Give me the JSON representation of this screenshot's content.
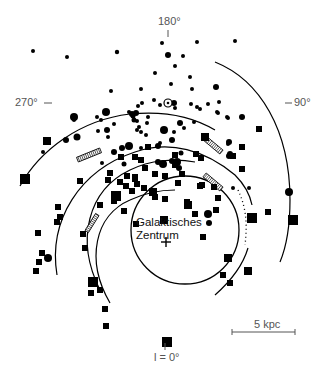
{
  "diagram": {
    "title": "",
    "center_label_line1": "Galaktisches",
    "center_label_line2": "Zentrum",
    "longitude_labels": {
      "top": "180°",
      "left": "270°",
      "right": "90°",
      "bottom": "l = 0°"
    },
    "scale_bar": {
      "label": "5 kpc",
      "length_px": 63
    },
    "colors": {
      "ink": "#000000",
      "label": "#555555",
      "background": "#ffffff"
    },
    "marker_types": [
      "circle",
      "square"
    ],
    "arcs": [
      {
        "name": "outer-arc",
        "cx": 163,
        "cy": 245,
        "r": 150,
        "start_deg": 195,
        "end_deg": 388
      },
      {
        "name": "arc-2",
        "cx": 163,
        "cy": 245,
        "r": 118,
        "start_deg": 200,
        "end_deg": 330
      },
      {
        "name": "arc-3",
        "cx": 163,
        "cy": 245,
        "r": 100,
        "start_deg": 190,
        "end_deg": 300
      },
      {
        "name": "inner-arc",
        "cx": 163,
        "cy": 245,
        "r": 74,
        "start_deg": 180,
        "end_deg": 420
      }
    ],
    "circles": [
      [
        117,
        52,
        2.2
      ],
      [
        33,
        51,
        2
      ],
      [
        67,
        57,
        2
      ],
      [
        162,
        43,
        2
      ],
      [
        197,
        42,
        2
      ],
      [
        168,
        55,
        3
      ],
      [
        183,
        56,
        2
      ],
      [
        155,
        73,
        2
      ],
      [
        171,
        84,
        2
      ],
      [
        235,
        41,
        2
      ],
      [
        190,
        77,
        2
      ],
      [
        192,
        89,
        2
      ],
      [
        141,
        89,
        2
      ],
      [
        191,
        104,
        2
      ],
      [
        142,
        103,
        2
      ],
      [
        133,
        116,
        2.5
      ],
      [
        134,
        120,
        2.5
      ],
      [
        74,
        117,
        4
      ],
      [
        106,
        112,
        4
      ],
      [
        137,
        121,
        2
      ],
      [
        139,
        127,
        2
      ],
      [
        141,
        132,
        2
      ],
      [
        154,
        100,
        2
      ],
      [
        147,
        123,
        2
      ],
      [
        164,
        130,
        4
      ],
      [
        172,
        140,
        3
      ],
      [
        180,
        123,
        3
      ],
      [
        184,
        128,
        2
      ],
      [
        194,
        122,
        2
      ],
      [
        160,
        143,
        2
      ],
      [
        181,
        153,
        2.5
      ],
      [
        200,
        109,
        2
      ],
      [
        218,
        113,
        2
      ],
      [
        216,
        87,
        3
      ],
      [
        177,
        162,
        4
      ],
      [
        172,
        161,
        3
      ],
      [
        108,
        137,
        2
      ],
      [
        129,
        146,
        4
      ],
      [
        141,
        148,
        2
      ],
      [
        146,
        135,
        2
      ],
      [
        158,
        146,
        3
      ],
      [
        66,
        140,
        3
      ],
      [
        77,
        137,
        3.5
      ],
      [
        43,
        152,
        2
      ],
      [
        174,
        103,
        3
      ],
      [
        174,
        132,
        2
      ],
      [
        233,
        188,
        2
      ],
      [
        249,
        188,
        2
      ],
      [
        107,
        130,
        3
      ],
      [
        114,
        124,
        2
      ],
      [
        74,
        120,
        2
      ],
      [
        208,
        104,
        2
      ],
      [
        217,
        112,
        2
      ],
      [
        179,
        168,
        3
      ],
      [
        197,
        107,
        2
      ],
      [
        219,
        102,
        2
      ],
      [
        229,
        142,
        3
      ],
      [
        48,
        258,
        4
      ],
      [
        228,
        118,
        2
      ],
      [
        227,
        117,
        2
      ],
      [
        137,
        130,
        2
      ],
      [
        209,
        223,
        3
      ],
      [
        208,
        214,
        4
      ],
      [
        175,
        66,
        2
      ],
      [
        160,
        105,
        2
      ],
      [
        111,
        91,
        2
      ],
      [
        228,
        144,
        2
      ],
      [
        242,
        117,
        3
      ],
      [
        229,
        156,
        3
      ],
      [
        289,
        192,
        4
      ],
      [
        97,
        117,
        2
      ],
      [
        148,
        117,
        2
      ],
      [
        101,
        120,
        2
      ],
      [
        129,
        112,
        2
      ],
      [
        136,
        113,
        3
      ],
      [
        175,
        108,
        2
      ],
      [
        114,
        152,
        3
      ],
      [
        122,
        148,
        3
      ],
      [
        230,
        154,
        3
      ],
      [
        98,
        131,
        2
      ],
      [
        132,
        114,
        3
      ],
      [
        138,
        106,
        2
      ],
      [
        102,
        163,
        2
      ],
      [
        124,
        164,
        2.5
      ],
      [
        163,
        164,
        4
      ],
      [
        158,
        162,
        3
      ]
    ],
    "squares": [
      [
        25,
        179,
        5
      ],
      [
        47,
        141,
        4
      ],
      [
        121,
        157,
        3
      ],
      [
        135,
        157,
        3
      ],
      [
        141,
        160,
        3
      ],
      [
        135,
        179,
        3
      ],
      [
        135,
        177,
        3
      ],
      [
        80,
        181,
        3
      ],
      [
        108,
        180,
        3
      ],
      [
        100,
        205,
        3
      ],
      [
        136,
        224,
        3
      ],
      [
        137,
        184,
        3
      ],
      [
        116,
        196,
        5
      ],
      [
        132,
        191,
        3
      ],
      [
        114,
        201,
        3
      ],
      [
        124,
        211,
        3
      ],
      [
        126,
        186,
        3
      ],
      [
        144,
        188,
        3
      ],
      [
        153,
        192,
        4
      ],
      [
        200,
        186,
        3
      ],
      [
        202,
        185,
        3
      ],
      [
        188,
        205,
        4
      ],
      [
        203,
        237,
        3
      ],
      [
        164,
        220,
        4
      ],
      [
        155,
        197,
        3
      ],
      [
        165,
        199,
        3
      ],
      [
        187,
        202,
        3
      ],
      [
        233,
        156,
        3
      ],
      [
        242,
        169,
        3
      ],
      [
        268,
        212,
        3
      ],
      [
        252,
        218,
        5
      ],
      [
        293,
        220,
        5
      ],
      [
        228,
        258,
        4
      ],
      [
        248,
        271,
        4
      ],
      [
        223,
        275,
        3
      ],
      [
        230,
        283,
        3
      ],
      [
        106,
        326,
        3
      ],
      [
        167,
        342,
        5
      ],
      [
        58,
        207,
        3
      ],
      [
        60,
        217,
        3
      ],
      [
        57,
        222,
        3
      ],
      [
        38,
        233,
        3
      ],
      [
        42,
        253,
        3
      ],
      [
        39,
        262,
        3
      ],
      [
        36,
        271,
        3
      ],
      [
        83,
        234,
        3
      ],
      [
        85,
        248,
        3
      ],
      [
        93,
        282,
        5
      ],
      [
        100,
        290,
        3
      ],
      [
        91,
        293,
        3
      ],
      [
        105,
        309,
        3
      ],
      [
        182,
        174,
        3
      ],
      [
        155,
        174,
        3
      ],
      [
        148,
        147,
        3
      ],
      [
        175,
        155,
        3
      ],
      [
        178,
        183,
        3
      ],
      [
        165,
        176,
        3
      ],
      [
        175,
        165,
        3
      ],
      [
        145,
        168,
        3
      ],
      [
        218,
        198,
        3
      ],
      [
        216,
        210,
        3
      ],
      [
        214,
        187,
        3
      ],
      [
        195,
        214,
        3
      ],
      [
        110,
        173,
        3
      ],
      [
        127,
        176,
        3
      ],
      [
        120,
        182,
        3
      ],
      [
        242,
        147,
        3
      ],
      [
        259,
        129,
        3
      ],
      [
        196,
        154,
        3
      ],
      [
        201,
        158,
        3
      ],
      [
        205,
        137,
        4
      ]
    ],
    "hatched_bars": [
      {
        "x": 89,
        "y": 155,
        "w": 25,
        "h": 5,
        "angle": -22
      },
      {
        "x": 92,
        "y": 223,
        "w": 20,
        "h": 4,
        "angle": -58
      },
      {
        "x": 213,
        "y": 145,
        "w": 22,
        "h": 5,
        "angle": 40
      },
      {
        "x": 213,
        "y": 182,
        "w": 22,
        "h": 5,
        "angle": 40
      }
    ],
    "dotted_arc": {
      "cx": 163,
      "cy": 245,
      "r": 87,
      "start_deg": 300,
      "end_deg": 355
    }
  }
}
